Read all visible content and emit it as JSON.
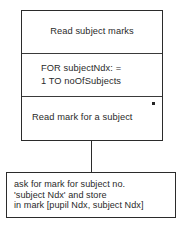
{
  "diagram": {
    "type": "program-structure-diagram",
    "main_box": {
      "sections": [
        {
          "name": "read-subject-marks",
          "text": "Read subject marks",
          "marker": null
        },
        {
          "name": "for-loop",
          "line1": "FOR subjectNdx: =",
          "line2": "1 TO noOfSubjects",
          "marker": null
        },
        {
          "name": "read-mark-for-subject",
          "text": "Read mark for a subject",
          "marker": "*"
        }
      ]
    },
    "note_box": {
      "lines": [
        "ask for mark for subject no.",
        "'subject Ndx' and store",
        "in mark [pupil Ndx, subject Ndx]"
      ]
    },
    "colors": {
      "border": "#2b2b2b",
      "divider": "#3a3a3a",
      "text": "#2a2a2a",
      "background": "#ffffff",
      "marker": "#242424"
    }
  }
}
